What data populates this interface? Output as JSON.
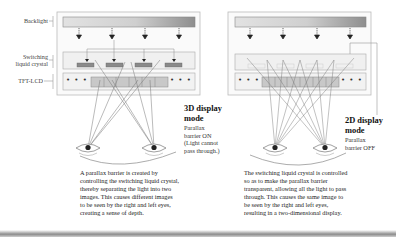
{
  "labels": {
    "backlight": "Backlight",
    "switching_lc_line1": "Switching",
    "switching_lc_line2": "liquid crystal",
    "tft_lcd": "TFT-LCD",
    "dots": "• • •"
  },
  "panel_3d": {
    "title_line1": "3D display",
    "title_line2": "mode",
    "sub_line1": "Parallax",
    "sub_line2": "barrier ON",
    "sub_line3": "(Light cannot",
    "sub_line4": "pass through.)",
    "caption_lines": [
      "A parallax barrier is created by",
      "controlling the switching liquid crystal,",
      "thereby separating the light into two",
      "images. This causes different images",
      "to be seen by the right and left eyes,",
      "creating a sense of depth."
    ]
  },
  "panel_2d": {
    "title_line1": "2D display",
    "title_line2": "mode",
    "sub_line1": "Parallax",
    "sub_line2": "barrier OFF",
    "caption_lines": [
      "The switching liquid crystal is controlled",
      "so as to make the parallax barrier",
      "transparent, allowing all the light to pass",
      "through. This causes the same image to",
      "be seen by the right and left eyes,",
      "resulting in a two-dimensional display."
    ]
  },
  "colors": {
    "frame": "#b5b5b5",
    "box_fill": "#f2f2f2",
    "barrier_fill": "#8a8a8a",
    "pixel_fill": "#c8c8c8",
    "ray": "#6a6a6a"
  }
}
